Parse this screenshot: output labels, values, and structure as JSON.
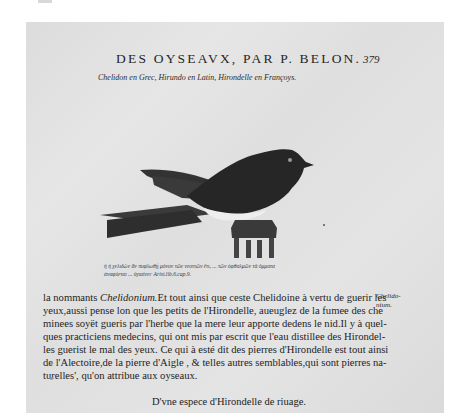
{
  "page": {
    "running_head": "DES OYSEAVX, PAR P. BELON.",
    "folio": "379",
    "caption": "Chelidon en Grec, Hirundo en Latin, Hirondelle en Françoys.",
    "illustration": {
      "subject": "swallow perched on a pedestal",
      "icon": "bird-woodcut-icon"
    },
    "greek_quote": [
      "ἡ ἡ χελιδὼν ἂν πυφλωθῇ μόνον τῶν νεοττῶν ἔτι, ... τῶν ὀφθαλμῶν τὰ ὄμματα",
      "ἀναφύεται ... ὑγιαίνει· Arist.lib.6.cap.9."
    ],
    "body_lines": [
      {
        "pre": "la nommants ",
        "italic": "Chelidonium.",
        "post": "Et tout ainsi que ceste Chelidoine à vertu de guerir les"
      },
      {
        "pre": "yeux,aussi pense lon que les petits de l'Hirondelle, aueuglez de la fumee des che",
        "italic": "",
        "post": ""
      },
      {
        "pre": "minees soyët gueris par l'herbe que la mere leur apporte dedens le nid.Il y à quel-",
        "italic": "",
        "post": ""
      },
      {
        "pre": "ques practiciens medecins, qui ont mis par escrit que l'eau distillee des Hirondel-",
        "italic": "",
        "post": ""
      },
      {
        "pre": "les guerist le mal des yeux. Ce qui à esté dit des pierres d'Hirondelle est tout ainsi",
        "italic": "",
        "post": ""
      },
      {
        "pre": "de l'Alectoire,de la pierre d'Aigle , & telles autres semblables,qui sont pierres na-",
        "italic": "",
        "post": ""
      },
      {
        "pre": "turelles', qu'on attribue aux oyseaux.",
        "italic": "",
        "post": ""
      }
    ],
    "margin_note": [
      "Chelido-",
      "nium."
    ],
    "section_heading": "D'vne espece d'Hirondelle de riuage."
  }
}
